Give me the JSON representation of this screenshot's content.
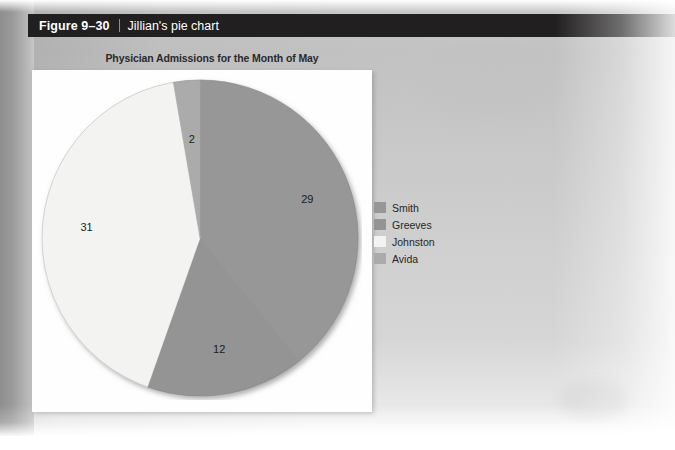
{
  "figure": {
    "number": "Figure 9–30",
    "separator": "|",
    "caption": "Jillian's pie chart"
  },
  "chart_data": {
    "type": "pie",
    "title": "Physician Admissions for the Month of May",
    "categories": [
      "Smith",
      "Greeves",
      "Johnston",
      "Avida"
    ],
    "values": [
      29,
      12,
      31,
      2
    ],
    "total": 74,
    "data_labels": [
      "29",
      "12",
      "31",
      "2"
    ],
    "colors": [
      "#979797",
      "#949494",
      "#f3f3f1",
      "#ababab"
    ],
    "legend_position": "right",
    "start_angle_deg": 0,
    "direction": "clockwise",
    "grid": false,
    "xlabel": "",
    "ylabel": ""
  },
  "legend": {
    "items": [
      {
        "label": "Smith",
        "color": "#979797"
      },
      {
        "label": "Greeves",
        "color": "#949494"
      },
      {
        "label": "Johnston",
        "color": "#f3f3f1"
      },
      {
        "label": "Avida",
        "color": "#ababab"
      }
    ]
  },
  "colors": {
    "caption_bar": "#211f20",
    "caption_text": "#ffffff",
    "panel_background": "#fefefe",
    "page_background": "#cfcfcf"
  }
}
